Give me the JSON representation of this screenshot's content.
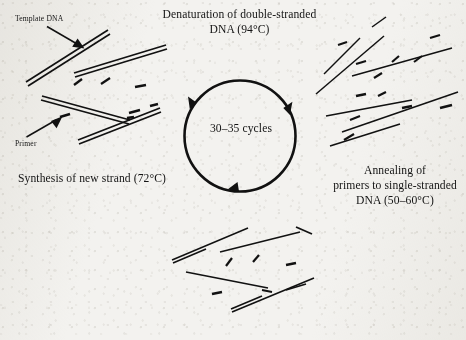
{
  "diagram": {
    "title_text": "PCR cycle diagram",
    "center_label": "30–35 cycles",
    "steps": [
      {
        "id": "denaturation",
        "lines": [
          "Denaturation of double-stranded",
          "DNA (94°C)"
        ],
        "full_text": "Denaturation of double-stranded DNA (94°C)",
        "temperature": "94°C"
      },
      {
        "id": "annealing",
        "lines": [
          "Annealing of",
          "primers to single-stranded",
          "DNA (50–60°C)"
        ],
        "full_text": "Annealing of primers to single-stranded DNA (50–60°C)",
        "temperature": "50–60°C"
      },
      {
        "id": "synthesis",
        "lines": [
          "Synthesis of new strand (72°C)"
        ],
        "full_text": "Synthesis of new strand (72°C)",
        "temperature": "72°C"
      }
    ],
    "callouts": [
      {
        "id": "template-dna",
        "label": "Template DNA"
      },
      {
        "id": "primer",
        "label": "Primer"
      }
    ],
    "colors": {
      "ink": "#141414",
      "paper": "#f3f2ef",
      "stroke": "#111111"
    },
    "cycle": {
      "arrow_count": 3,
      "direction": "clockwise",
      "count_range": "30–35"
    }
  }
}
